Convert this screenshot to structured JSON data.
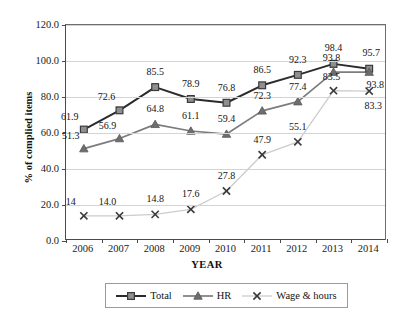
{
  "chart_data": {
    "type": "line",
    "title": "",
    "xlabel": "YEAR",
    "ylabel": "% of complied items",
    "categories": [
      "2006",
      "2007",
      "2008",
      "2009",
      "2010",
      "2011",
      "2012",
      "2013",
      "2014"
    ],
    "ylim": [
      0.0,
      120.0
    ],
    "yticks": [
      "0.0",
      "20.0",
      "40.0",
      "60.0",
      "80.0",
      "100.0",
      "120.0"
    ],
    "ytick_values": [
      0,
      20,
      40,
      60,
      80,
      100,
      120
    ],
    "grid": "horizontal",
    "legend_position": "bottom",
    "series": [
      {
        "name": "Total",
        "marker": "square",
        "color": "#2b2b2b",
        "marker_fill": "#8f8f8f",
        "values": [
          61.9,
          72.6,
          85.5,
          78.9,
          76.8,
          86.5,
          92.3,
          98.4,
          95.7
        ],
        "labels": [
          "61.9",
          "72.6",
          "85.5",
          "78.9",
          "76.8",
          "86.5",
          "92.3",
          "98.4",
          "95.7"
        ]
      },
      {
        "name": "HR",
        "marker": "triangle",
        "color": "#7c7c7c",
        "marker_fill": "#6e6e6e",
        "values": [
          51.3,
          56.9,
          64.8,
          61.1,
          59.4,
          72.3,
          77.4,
          93.8,
          93.8
        ],
        "labels": [
          "51.3",
          "56.9",
          "64.8",
          "61.1",
          "59.4",
          "72.3",
          "77.4",
          "93.8",
          "93.8"
        ]
      },
      {
        "name": "Wage & hours",
        "marker": "cross",
        "color": "#cccccc",
        "marker_fill": "#3a3a3a",
        "values": [
          14.0,
          14.0,
          14.8,
          17.6,
          27.8,
          47.9,
          55.1,
          83.5,
          83.3
        ],
        "labels": [
          "14",
          "14.0",
          "14.8",
          "17.6",
          "27.8",
          "47.9",
          "55.1",
          "83.5",
          "83.3"
        ]
      }
    ],
    "label_offsets": [
      [
        [
          -14,
          -13
        ],
        [
          -13,
          -13
        ],
        [
          0,
          -15
        ],
        [
          0,
          -15
        ],
        [
          0,
          -15
        ],
        [
          0,
          -15
        ],
        [
          0,
          -15
        ],
        [
          0,
          -16
        ],
        [
          2,
          -16
        ]
      ],
      [
        [
          -13,
          -13
        ],
        [
          -12,
          -13
        ],
        [
          0,
          -15
        ],
        [
          0,
          -15
        ],
        [
          0,
          -15
        ],
        [
          0,
          -15
        ],
        [
          0,
          -15
        ],
        [
          -2,
          -14
        ],
        [
          6,
          13
        ]
      ],
      [
        [
          -13,
          -14
        ],
        [
          -12,
          -14
        ],
        [
          0,
          -15
        ],
        [
          0,
          -15
        ],
        [
          0,
          -15
        ],
        [
          0,
          -15
        ],
        [
          0,
          -15
        ],
        [
          -2,
          -14
        ],
        [
          4,
          15
        ]
      ]
    ]
  },
  "legend": {
    "items": [
      {
        "label": "Total",
        "marker": "square-marker",
        "swatch": "legend-swatch-total"
      },
      {
        "label": "HR",
        "marker": "triangle-marker",
        "swatch": "legend-swatch-hr"
      },
      {
        "label": "Wage & hours",
        "marker": "cross-marker",
        "swatch": "legend-swatch-wage"
      }
    ]
  }
}
